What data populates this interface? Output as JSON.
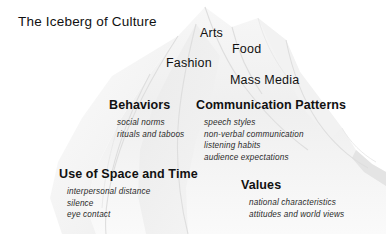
{
  "diagram": {
    "title": "The Iceberg of Culture",
    "background_color": "#ffffff",
    "text_color": "#111111",
    "iceberg_color": "#f1f1f1",
    "iceberg_shade_color": "#e6e6e6",
    "iceberg_line_color": "#dcdcdc"
  },
  "surface_labels": [
    {
      "text": "Arts"
    },
    {
      "text": "Food"
    },
    {
      "text": "Fashion"
    },
    {
      "text": "Mass Media"
    }
  ],
  "categories": [
    {
      "heading": "Behaviors",
      "items": [
        "social norms",
        "rituals and taboos"
      ]
    },
    {
      "heading": "Communication Patterns",
      "items": [
        "speech styles",
        "non-verbal communication",
        "listening habits",
        "audience expectations"
      ]
    },
    {
      "heading": "Use of Space and Time",
      "items": [
        "interpersonal distance",
        "silence",
        "eye contact"
      ]
    },
    {
      "heading": "Values",
      "items": [
        "national characteristics",
        "attitudes and world views"
      ]
    }
  ]
}
